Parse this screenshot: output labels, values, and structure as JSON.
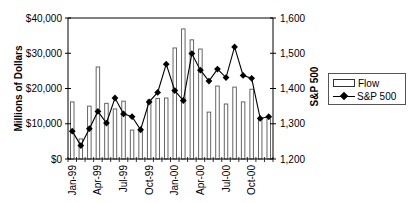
{
  "chart_data": {
    "type": "bar+line",
    "title": "",
    "categories": [
      "Jan-99",
      "Feb-99",
      "Mar-99",
      "Apr-99",
      "May-99",
      "Jun-99",
      "Jul-99",
      "Aug-99",
      "Sep-99",
      "Oct-99",
      "Nov-99",
      "Dec-99",
      "Jan-00",
      "Feb-00",
      "Mar-00",
      "Apr-00",
      "May-00",
      "Jun-00",
      "Jul-00",
      "Aug-00",
      "Sep-00",
      "Oct-00",
      "Nov-00",
      "Dec-00"
    ],
    "x_tick_labels": [
      "Jan-99",
      "Apr-99",
      "Jul-99",
      "Oct-99",
      "Jan-00",
      "Apr-00",
      "Jul-00",
      "Oct-00"
    ],
    "series": [
      {
        "name": "Flow",
        "type": "bar",
        "axis": "left",
        "values": [
          16200,
          5700,
          15000,
          26100,
          15800,
          14200,
          16400,
          8200,
          8500,
          16700,
          17200,
          17300,
          31500,
          36900,
          33800,
          31200,
          13300,
          20700,
          15600,
          20400,
          16200,
          19800,
          11300,
          11400
        ]
      },
      {
        "name": "S&P 500",
        "type": "line",
        "axis": "right",
        "values": [
          1279,
          1238,
          1286,
          1335,
          1302,
          1373,
          1328,
          1320,
          1283,
          1362,
          1389,
          1469,
          1394,
          1366,
          1499,
          1452,
          1421,
          1455,
          1431,
          1518,
          1437,
          1429,
          1315,
          1320
        ]
      }
    ],
    "ylabel": "Millions of Dollars",
    "y2label": "S&P 500",
    "ylim": [
      0,
      40000
    ],
    "y2lim": [
      1200,
      1600
    ],
    "y_tick_labels": [
      "$0",
      "$10,000",
      "$20,000",
      "$30,000",
      "$40,000"
    ],
    "y_ticks": [
      0,
      10000,
      20000,
      30000,
      40000
    ],
    "y2_tick_labels": [
      "1,200",
      "1,300",
      "1,400",
      "1,500",
      "1,600"
    ],
    "y2_ticks": [
      1200,
      1300,
      1400,
      1500,
      1600
    ],
    "grid": false,
    "legend_position": "right"
  },
  "legend": {
    "flow_label": "Flow",
    "sp_label": "S&P 500"
  }
}
